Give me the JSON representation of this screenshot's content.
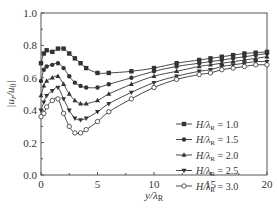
{
  "chart_data": {
    "type": "line",
    "title": "",
    "xlabel": "y/λR",
    "ylabel": "|ur/u0|",
    "xlim": [
      0,
      20
    ],
    "ylim": [
      0.0,
      1.0
    ],
    "xticks": [
      0,
      5,
      10,
      15,
      20
    ],
    "yticks": [
      0.0,
      0.2,
      0.4,
      0.6,
      0.8,
      1.0
    ],
    "xtick_labels": [
      "0",
      "5",
      "10",
      "15",
      "20"
    ],
    "ytick_labels": [
      "0.0",
      "0.2",
      "0.4",
      "0.6",
      "0.8",
      "1.0"
    ],
    "grid": false,
    "legend_position": "lower right",
    "series": [
      {
        "name": "H/λR = 1.0",
        "marker": "square",
        "x": [
          0,
          0.25,
          0.5,
          1.0,
          1.5,
          2.0,
          2.5,
          3.0,
          3.5,
          4.0,
          5.0,
          6.0,
          8.0,
          10.0,
          12.0,
          14.0,
          15.0,
          16.0,
          17.0,
          18.0,
          19.0,
          20.0
        ],
        "y": [
          0.69,
          0.75,
          0.77,
          0.76,
          0.78,
          0.78,
          0.75,
          0.72,
          0.69,
          0.66,
          0.63,
          0.63,
          0.64,
          0.66,
          0.69,
          0.71,
          0.72,
          0.73,
          0.74,
          0.75,
          0.755,
          0.76
        ]
      },
      {
        "name": "H/λR = 1.5",
        "marker": "circle",
        "x": [
          0,
          0.25,
          0.5,
          1.0,
          1.5,
          2.0,
          2.5,
          3.0,
          3.5,
          4.0,
          5.0,
          6.0,
          8.0,
          10.0,
          12.0,
          14.0,
          15.0,
          16.0,
          17.0,
          18.0,
          19.0,
          20.0
        ],
        "y": [
          0.58,
          0.65,
          0.67,
          0.68,
          0.69,
          0.66,
          0.61,
          0.57,
          0.55,
          0.54,
          0.54,
          0.56,
          0.6,
          0.64,
          0.67,
          0.69,
          0.7,
          0.71,
          0.72,
          0.73,
          0.74,
          0.75
        ]
      },
      {
        "name": "H/λR = 2.0",
        "marker": "triangle-up",
        "x": [
          0,
          0.25,
          0.5,
          1.0,
          1.5,
          2.0,
          2.5,
          3.0,
          3.5,
          4.0,
          5.0,
          6.0,
          8.0,
          10.0,
          12.0,
          14.0,
          15.0,
          16.0,
          17.0,
          18.0,
          19.0,
          20.0
        ],
        "y": [
          0.49,
          0.55,
          0.58,
          0.6,
          0.61,
          0.56,
          0.5,
          0.46,
          0.44,
          0.44,
          0.46,
          0.5,
          0.56,
          0.61,
          0.64,
          0.67,
          0.68,
          0.69,
          0.7,
          0.71,
          0.72,
          0.73
        ]
      },
      {
        "name": "H/λR = 2.5",
        "marker": "triangle-down",
        "x": [
          0,
          0.25,
          0.5,
          1.0,
          1.5,
          2.0,
          2.5,
          3.0,
          3.5,
          4.0,
          5.0,
          6.0,
          8.0,
          10.0,
          12.0,
          14.0,
          15.0,
          16.0,
          17.0,
          18.0,
          19.0,
          20.0
        ],
        "y": [
          0.4,
          0.45,
          0.49,
          0.52,
          0.54,
          0.47,
          0.4,
          0.35,
          0.34,
          0.35,
          0.39,
          0.44,
          0.51,
          0.57,
          0.61,
          0.64,
          0.65,
          0.67,
          0.68,
          0.69,
          0.7,
          0.7
        ]
      },
      {
        "name": "H/λR = 3.0",
        "marker": "circle-open",
        "x": [
          0,
          0.25,
          0.5,
          1.0,
          1.5,
          2.0,
          2.5,
          3.0,
          3.5,
          4.0,
          5.0,
          6.0,
          8.0,
          10.0,
          12.0,
          14.0,
          15.0,
          16.0,
          17.0,
          18.0,
          19.0,
          20.0
        ],
        "y": [
          0.36,
          0.38,
          0.42,
          0.46,
          0.47,
          0.38,
          0.3,
          0.26,
          0.26,
          0.28,
          0.33,
          0.39,
          0.47,
          0.54,
          0.59,
          0.62,
          0.63,
          0.65,
          0.66,
          0.67,
          0.68,
          0.68
        ]
      }
    ]
  },
  "axes": {
    "xlabel_main": "y/λ",
    "xlabel_sub": "R",
    "ylabel_text": "|u",
    "ylabel_sub1": "r",
    "ylabel_mid": "/u",
    "ylabel_sub2": "0",
    "ylabel_end": "|"
  },
  "legend": {
    "items": [
      {
        "prefix": "H/λ",
        "sub": "R",
        "suffix": " = 1.0"
      },
      {
        "prefix": "H/λ",
        "sub": "R",
        "suffix": " = 1.5"
      },
      {
        "prefix": "H/λ",
        "sub": "R",
        "suffix": " = 2.0"
      },
      {
        "prefix": "H/λ",
        "sub": "R",
        "suffix": " = 2.5"
      },
      {
        "prefix": "H/λ",
        "sub": "R",
        "suffix": " = 3.0"
      }
    ]
  },
  "colors": {
    "line": "#333333",
    "axis": "#555555",
    "background": "#ffffff"
  }
}
